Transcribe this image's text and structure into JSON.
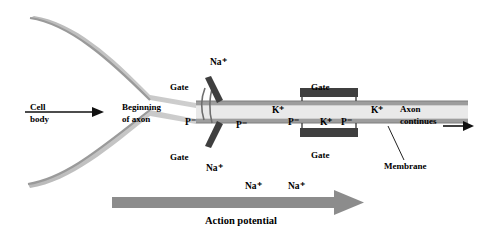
{
  "figure": {
    "type": "neuron-axon-action-potential-diagram",
    "background": "#ffffff",
    "colors": {
      "cell_outline": "#9a9a9a",
      "axon_fill": "#c8c8c8",
      "membrane_line": "#8a8a8a",
      "gate_dark": "#3a3a3a",
      "arrow_gray": "#8c8c8c",
      "text": "#000000"
    }
  },
  "labels": {
    "cell_body": "Cell\nbody",
    "cell_body_line1": "Cell",
    "cell_body_line2": "body",
    "beginning_line1": "Beginning",
    "beginning_line2": "of axon",
    "gate_top": "Gate",
    "gate_bottom": "Gate",
    "gate_right_top": "Gate",
    "gate_right_bottom": "Gate",
    "axon_continues_line1": "Axon",
    "axon_continues_line2": "continues",
    "membrane": "Membrane",
    "action_potential": "Action potential"
  },
  "ions": {
    "na_top_left": "Na⁺",
    "na_bottom_left": "Na⁺",
    "na_bottom_mid": "Na⁺",
    "na_bottom_right": "Na⁺",
    "k_inside_left": "K⁺",
    "k_inside_mid": "K⁺",
    "k_right": "K⁺",
    "p_left_outer": "P⁻",
    "p_inner_left": "P⁻",
    "p_inner_mid": "P⁻",
    "p_inner_right": "P⁻"
  }
}
